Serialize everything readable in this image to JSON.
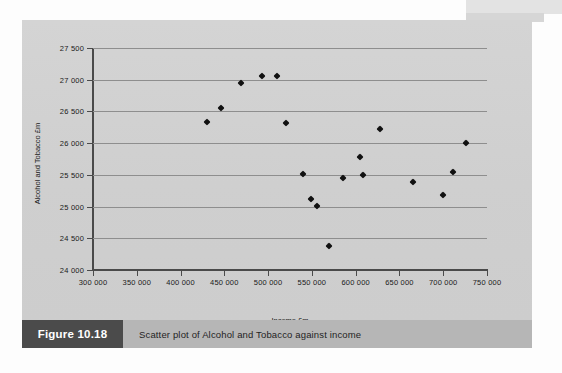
{
  "figure": {
    "tag": "Figure 10.18",
    "caption": "Scatter plot of Alcohol and Tobacco against income"
  },
  "colors": {
    "panel_background": "#d2d2d2",
    "caption_bar": "#b6b6b6",
    "caption_tag": "#4b4b4b",
    "gridline": "#8e8e8e",
    "axis": "#4a4a4a",
    "marker": "#111111"
  },
  "chart_data": {
    "type": "scatter",
    "title": "",
    "xlabel": "Income £m",
    "ylabel": "Alcohol and Tobacco £m",
    "xlim": [
      300000,
      750000
    ],
    "ylim": [
      24000,
      27500
    ],
    "xticks": [
      300000,
      350000,
      400000,
      450000,
      500000,
      550000,
      600000,
      650000,
      700000,
      750000
    ],
    "yticks": [
      24000,
      24500,
      25000,
      25500,
      26000,
      26500,
      27000,
      27500
    ],
    "xtick_labels": [
      "300 000",
      "350 000",
      "400 000",
      "450 000",
      "500 000",
      "550 000",
      "600 000",
      "650 000",
      "700 000",
      "750 000"
    ],
    "ytick_labels": [
      "24 000",
      "24 500",
      "25 000",
      "25 500",
      "26 000",
      "26 500",
      "27 000",
      "27 500"
    ],
    "grid": "horizontal",
    "legend": "none",
    "marker": "filled-diamond",
    "points": [
      {
        "x": 430000,
        "y": 26340
      },
      {
        "x": 446000,
        "y": 26560
      },
      {
        "x": 469000,
        "y": 26950
      },
      {
        "x": 493000,
        "y": 27060
      },
      {
        "x": 510000,
        "y": 27060
      },
      {
        "x": 521000,
        "y": 26320
      },
      {
        "x": 540000,
        "y": 25510
      },
      {
        "x": 549000,
        "y": 25120
      },
      {
        "x": 556000,
        "y": 25010
      },
      {
        "x": 570000,
        "y": 24380
      },
      {
        "x": 585000,
        "y": 25450
      },
      {
        "x": 605000,
        "y": 25780
      },
      {
        "x": 608000,
        "y": 25500
      },
      {
        "x": 628000,
        "y": 26230
      },
      {
        "x": 666000,
        "y": 25390
      },
      {
        "x": 700000,
        "y": 25190
      },
      {
        "x": 711000,
        "y": 25540
      },
      {
        "x": 726000,
        "y": 26000
      }
    ]
  }
}
